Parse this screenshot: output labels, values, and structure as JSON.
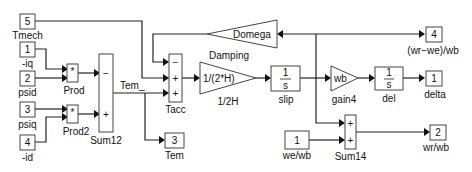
{
  "diagram": {
    "type": "simulink-block-diagram",
    "inports": [
      {
        "number": "5",
        "label": "Tmech"
      },
      {
        "number": "1",
        "label": "-iq"
      },
      {
        "number": "2",
        "label": "psid"
      },
      {
        "number": "3",
        "label": "psiq"
      },
      {
        "number": "4",
        "label": "-id"
      },
      {
        "number": "1",
        "label": "we/wb"
      }
    ],
    "products": [
      {
        "name": "Prod",
        "symbol": "*"
      },
      {
        "name": "Prod2",
        "symbol": "*"
      }
    ],
    "sums": [
      {
        "name": "Sum12",
        "signs": [
          "−",
          "+"
        ]
      },
      {
        "name": "Tacc",
        "signs": [
          "−",
          "+",
          "+"
        ]
      },
      {
        "name": "Sum14",
        "signs": [
          "+",
          "+"
        ]
      }
    ],
    "gains": [
      {
        "name": "1/2H",
        "value": "1/(2*H)"
      },
      {
        "name": "Damping",
        "value": "Domega"
      },
      {
        "name": "gain4",
        "value": "wb"
      }
    ],
    "integrators": [
      {
        "name": "slip",
        "num": "1",
        "den": "s"
      },
      {
        "name": "del",
        "num": "1",
        "den": "s"
      }
    ],
    "signal_labels": {
      "tem": "Tem_"
    },
    "outports": [
      {
        "number": "3",
        "label": "Tem"
      },
      {
        "number": "4",
        "label": "(wr−we)/wb"
      },
      {
        "number": "1",
        "label": "delta"
      },
      {
        "number": "2",
        "label": "wr/wb"
      }
    ]
  }
}
